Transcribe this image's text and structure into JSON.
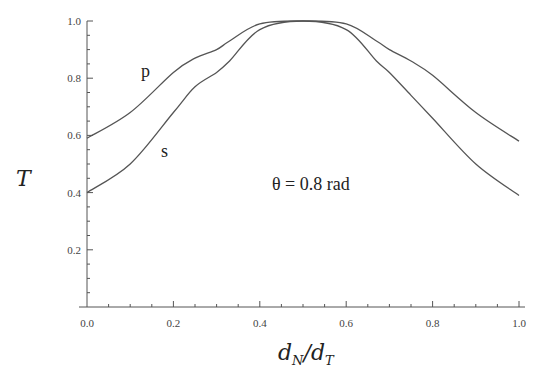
{
  "chart_data": {
    "type": "line",
    "title": "",
    "xlabel": "d_N/d_T",
    "ylabel": "T",
    "xlim": [
      0.0,
      1.0
    ],
    "ylim": [
      0.0,
      1.0
    ],
    "grid": false,
    "legend": "none (curves labeled inline)",
    "x_ticks": [
      "0.0",
      "0.2",
      "0.4",
      "0.6",
      "0.8",
      "1.0"
    ],
    "y_ticks": [
      "0.2",
      "0.4",
      "0.6",
      "0.8",
      "1.0"
    ],
    "x": [
      0.0,
      0.1,
      0.2,
      0.25,
      0.3,
      0.33,
      0.4,
      0.5,
      0.6,
      0.67,
      0.7,
      0.75,
      0.8,
      0.9,
      1.0
    ],
    "series": [
      {
        "name": "p",
        "values": [
          0.59,
          0.68,
          0.82,
          0.87,
          0.9,
          0.93,
          0.99,
          1.0,
          0.99,
          0.93,
          0.9,
          0.86,
          0.81,
          0.68,
          0.58
        ]
      },
      {
        "name": "s",
        "values": [
          0.4,
          0.5,
          0.68,
          0.77,
          0.82,
          0.86,
          0.97,
          1.0,
          0.97,
          0.86,
          0.82,
          0.74,
          0.66,
          0.5,
          0.39
        ]
      }
    ],
    "annotations": [
      "θ = 0.8 rad",
      "p",
      "s"
    ]
  },
  "labels": {
    "y_axis": "T",
    "x_axis_main": "d",
    "x_axis_sub1": "N",
    "x_axis_slash": "/d",
    "x_axis_sub2": "T",
    "curve_p": "p",
    "curve_s": "s",
    "annotation": "θ = 0.8 rad"
  }
}
